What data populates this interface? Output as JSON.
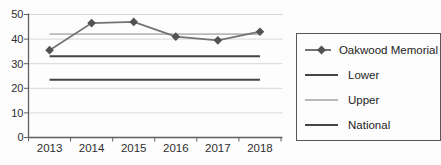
{
  "chart_data": {
    "type": "line",
    "title": "",
    "categories": [
      "2013",
      "2014",
      "2015",
      "2016",
      "2017",
      "2018"
    ],
    "series": [
      {
        "name": "Oakwood Memorial",
        "values": [
          35.5,
          46.5,
          47,
          41,
          39.5,
          43
        ],
        "color": "#737373",
        "marker": "diamond",
        "marker_color": "#525252",
        "line_width": 1.8
      },
      {
        "name": "Lower",
        "values": [
          33,
          33,
          33,
          33,
          33,
          33
        ],
        "color": "#454545",
        "marker": "none",
        "line_width": 2
      },
      {
        "name": "Upper",
        "values": [
          42,
          42,
          42,
          42,
          42,
          42
        ],
        "color": "#b9b9b9",
        "marker": "none",
        "line_width": 1.8
      },
      {
        "name": "National",
        "values": [
          23.5,
          23.5,
          23.5,
          23.5,
          23.5,
          23.5
        ],
        "color": "#454545",
        "marker": "none",
        "line_width": 2
      }
    ],
    "ylim": [
      0,
      50
    ],
    "ytick_step": 10,
    "yticks": [
      "0",
      "10",
      "20",
      "30",
      "40",
      "50"
    ],
    "xlabel": "",
    "ylabel": "",
    "grid": "horizontal",
    "legend_position": "right"
  },
  "colors": {
    "background": "#fdfdfd",
    "gridline": "#d8d8d8",
    "axis": "#5f5f5f",
    "text": "#2e2e2e",
    "legend_border": "#575757"
  }
}
